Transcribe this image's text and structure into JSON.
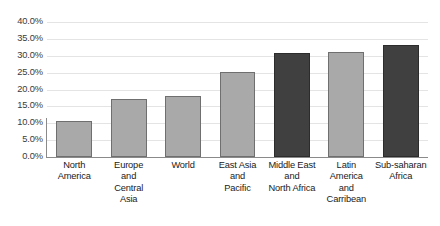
{
  "chart_data": {
    "type": "bar",
    "title": "",
    "subtitle": "",
    "xlabel": "",
    "ylabel": "",
    "ylim": [
      0,
      40
    ],
    "ytick_labels": [
      "40.0%",
      "35.0%",
      "30.0%",
      "25.0%",
      "20.0%",
      "15.0%",
      "10.0%",
      "5.0%",
      "0.0%"
    ],
    "ytick_values": [
      40,
      35,
      30,
      25,
      20,
      15,
      10,
      5,
      0
    ],
    "grid": true,
    "legend": "none",
    "categories": [
      "North America",
      "Europe and Central Asia",
      "World",
      "East Asia and Pacific",
      "Middle East and North Africa",
      "Latin America and Carribean",
      "Sub-saharan Africa"
    ],
    "category_lines": [
      [
        "North",
        "America"
      ],
      [
        "Europe",
        "and",
        "Central",
        "Asia"
      ],
      [
        "World"
      ],
      [
        "East Asia",
        "and",
        "Pacific"
      ],
      [
        "Middle East",
        "and",
        "North Africa"
      ],
      [
        "Latin",
        "America",
        "and",
        "Carribean"
      ],
      [
        "Sub-saharan",
        "Africa"
      ]
    ],
    "values": [
      10.7,
      17.2,
      18.1,
      25.2,
      30.8,
      31.1,
      33.2
    ],
    "value_labels": [
      "10.7%",
      "17.2%",
      "18.1%",
      "25.2%",
      "30.8%",
      "31.1%",
      "33.2%"
    ],
    "bar_styles": [
      "light",
      "light",
      "light",
      "light",
      "dark",
      "light",
      "dark"
    ]
  },
  "colors": {
    "bar_light": "#a9a9a9",
    "bar_dark": "#404040",
    "bar_light_border": "#6f6f6f",
    "bar_dark_border": "#2c2c2c",
    "gridline": "#e4e4e4",
    "axis": "#8a8a8a",
    "tick_text": "#3a3a3a",
    "category_text": "#1a1a1a",
    "background": "#ffffff"
  }
}
